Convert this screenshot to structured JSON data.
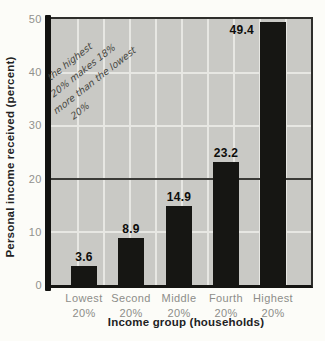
{
  "chart_data": {
    "type": "bar",
    "title": "",
    "xlabel": "Income group (households)",
    "ylabel": "Personal income received (percent)",
    "ylim": [
      0,
      50
    ],
    "ytick_labels": [
      "50",
      "40",
      "30",
      "20",
      "10",
      "0"
    ],
    "grid": true,
    "reference_line_y": 20,
    "categories": [
      "Lowest 20%",
      "Second 20%",
      "Middle 20%",
      "Fourth 20%",
      "Highest 20%"
    ],
    "values": [
      3.6,
      8.9,
      14.9,
      23.2,
      49.4
    ],
    "bars": [
      {
        "category_line1": "Lowest",
        "category_line2": "20%",
        "value": 3.6,
        "label": "3.6"
      },
      {
        "category_line1": "Second",
        "category_line2": "20%",
        "value": 8.9,
        "label": "8.9"
      },
      {
        "category_line1": "Middle",
        "category_line2": "20%",
        "value": 14.9,
        "label": "14.9"
      },
      {
        "category_line1": "Fourth",
        "category_line2": "20%",
        "value": 23.2,
        "label": "23.2"
      },
      {
        "category_line1": "Highest",
        "category_line2": "20%",
        "value": 49.4,
        "label": "49.4"
      }
    ]
  },
  "annotation": {
    "lines": [
      "the highest",
      "20% makes 18%",
      "more than the lowest",
      "20%"
    ]
  },
  "colors": {
    "bar": "#161613",
    "plot_background": "#c9c9c5",
    "gridline": "#e7e7e3",
    "reference_line": "#3a3a37",
    "axis_line": "#121210",
    "tick_text": "#91918d",
    "title_text": "#22221f",
    "value_text": "#0d0d0b",
    "handwriting": "#46463f"
  }
}
